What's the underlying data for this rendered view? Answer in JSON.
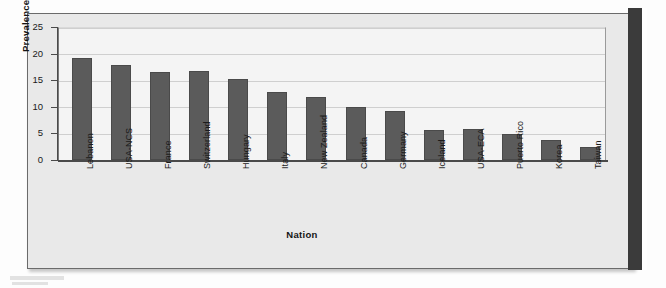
{
  "chart_data": {
    "type": "bar",
    "title": "",
    "xlabel": "Nation",
    "ylabel": "Prevalence (%)",
    "categories": [
      "Lebanon",
      "USA-NCS",
      "France",
      "Switzerland",
      "Hungary",
      "Italy",
      "New Zealand",
      "Canada",
      "Germany",
      "Iceland",
      "USA-ECA",
      "Puerto Rico",
      "Korea",
      "Taiwan"
    ],
    "values": [
      19.2,
      17.8,
      16.6,
      16.7,
      15.2,
      12.8,
      11.9,
      10.0,
      9.2,
      5.6,
      5.9,
      4.8,
      3.7,
      2.4
    ],
    "ylim": [
      0,
      25
    ],
    "yticks": [
      0,
      5,
      10,
      15,
      20,
      25
    ],
    "ytick_labels": [
      "0",
      "5",
      "10",
      "15",
      "20",
      "25"
    ],
    "grid": true,
    "legend": false,
    "bar_color": "#5b5b5b",
    "plot_background": "#f4f4f4",
    "figure_background": "#e9e9e9",
    "gridline_color": "#cfcfcf",
    "axis_color": "#4a4a4a"
  }
}
